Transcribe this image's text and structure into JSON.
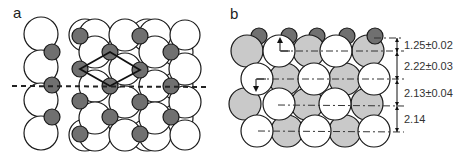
{
  "panels": {
    "a": {
      "label": "a",
      "description": "Top view of surface atomic arrangement with unit cell rhombus and dashed cut line"
    },
    "b": {
      "label": "b",
      "description": "Side view cross section showing interlayer spacings",
      "spacings": [
        {
          "value": "1.25±0.02"
        },
        {
          "value": "2.22±0.03"
        },
        {
          "value": "2.13±0.04"
        },
        {
          "value": "2.14"
        }
      ]
    }
  },
  "colors": {
    "large_atom": "#ffffff",
    "back_atom": "#c9c9c9",
    "small_atom": "#707070",
    "outline": "#1a1a1a"
  }
}
